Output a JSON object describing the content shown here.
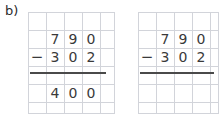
{
  "exercise": {
    "label": "b)"
  },
  "background_color": "#ffffff",
  "grid_color": "#d2d4da",
  "digit_color": "#3a3a3a",
  "rule_color": "#4a4a4a",
  "problems": [
    {
      "id": "left",
      "name": "worked-example",
      "minuend": "790",
      "subtrahend": "302",
      "operator": "−",
      "difference": "400",
      "minuend_digits": [
        "7",
        "9",
        "0"
      ],
      "subtrahend_digits": [
        "3",
        "0",
        "2"
      ],
      "difference_digits": [
        "4",
        "0",
        "0"
      ],
      "show_answer": true
    },
    {
      "id": "right",
      "name": "blank-exercise",
      "minuend": "790",
      "subtrahend": "302",
      "operator": "−",
      "difference": "",
      "minuend_digits": [
        "7",
        "9",
        "0"
      ],
      "subtrahend_digits": [
        "3",
        "0",
        "2"
      ],
      "difference_digits": [
        "",
        "",
        ""
      ],
      "show_answer": false
    }
  ]
}
